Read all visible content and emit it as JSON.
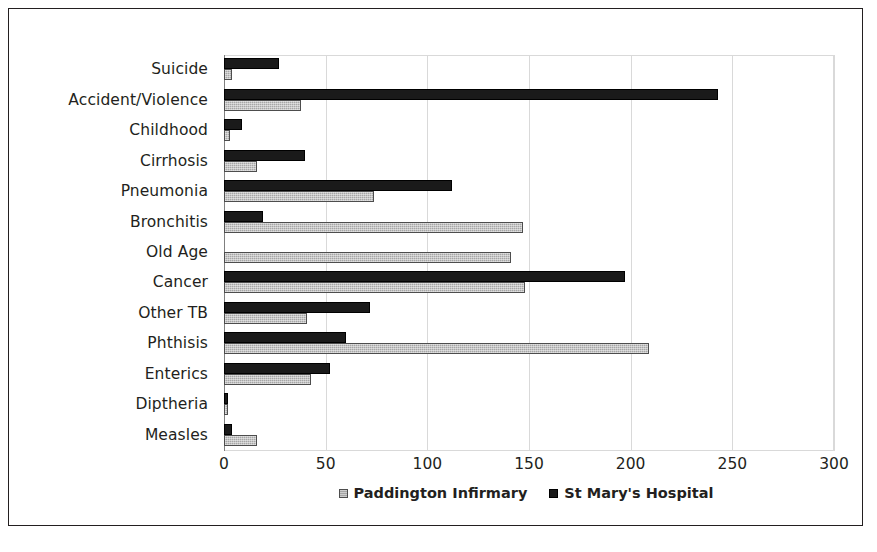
{
  "chart_data": {
    "type": "bar",
    "orientation": "horizontal",
    "title": "",
    "xlabel": "",
    "ylabel": "",
    "xlim": [
      0,
      300
    ],
    "xticks": [
      "0",
      "50",
      "100",
      "150",
      "200",
      "250",
      "300"
    ],
    "grid": true,
    "legend_position": "bottom-center",
    "categories": [
      "Suicide",
      "Accident/Violence",
      "Childhood",
      "Cirrhosis",
      "Pneumonia",
      "Bronchitis",
      "Old Age",
      "Cancer",
      "Other TB",
      "Phthisis",
      "Enterics",
      "Diptheria",
      "Measles"
    ],
    "series": [
      {
        "name": "Paddington Infirmary",
        "color": "#a6a6a6",
        "values": [
          4,
          38,
          3,
          16,
          74,
          147,
          141,
          148,
          41,
          209,
          43,
          2,
          16
        ]
      },
      {
        "name": "St Mary's Hospital",
        "color": "#1a1a1a",
        "values": [
          27,
          243,
          9,
          40,
          112,
          19,
          0,
          197,
          72,
          60,
          52,
          2,
          4
        ]
      }
    ]
  },
  "legend": {
    "items": [
      {
        "label": "Paddington Infirmary",
        "swatch": "light"
      },
      {
        "label": "St Mary's Hospital",
        "swatch": "dark"
      }
    ]
  }
}
